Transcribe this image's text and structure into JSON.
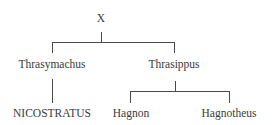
{
  "tree": {
    "root": {
      "label": "X"
    },
    "level1": [
      {
        "label": "Thrasymachus"
      },
      {
        "label": "Thrasippus"
      }
    ],
    "level2": [
      {
        "label": "NICOSTRATUS",
        "parent": "Thrasymachus"
      },
      {
        "label": "Hagnon",
        "parent": "Thrasippus"
      },
      {
        "label": "Hagnotheus",
        "parent": "Thrasippus"
      }
    ]
  }
}
